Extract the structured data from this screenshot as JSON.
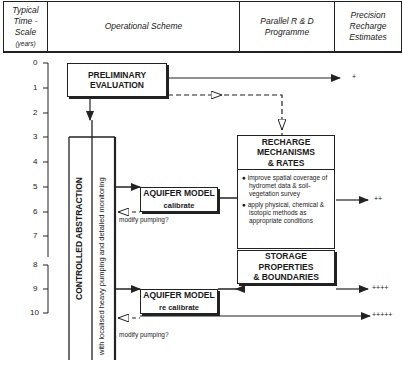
{
  "header": {
    "col1": {
      "line1": "Typical",
      "line2": "Time -",
      "line3": "Scale",
      "unit": "(years)"
    },
    "col2": "Operational Scheme",
    "col3": {
      "line1": "Parallel R & D",
      "line2": "Programme"
    },
    "col4": {
      "line1": "Precision",
      "line2": "Recharge",
      "line3": "Estimates"
    }
  },
  "time_axis": {
    "ticks": [
      "0",
      "1",
      "2",
      "3",
      "4",
      "5",
      "6",
      "7",
      "8",
      "9",
      "10"
    ]
  },
  "boxes": {
    "preliminary": {
      "line1": "PRELIMINARY",
      "line2": "EVALUATION"
    },
    "recharge": {
      "line1": "RECHARGE",
      "line2": "MECHANISMS",
      "line3": "& RATES"
    },
    "recharge_bullets": [
      "● improve spatial coverage of hydromet data & soil-vegetation survey",
      "● apply physical, chemical & isotopic methods as appropriate conditions"
    ],
    "storage": {
      "line1": "STORAGE",
      "line2": "PROPERTIES",
      "line3": "& BOUNDARIES"
    },
    "aquifer1": {
      "title": "AQUIFER MODEL",
      "sub": "calibrate"
    },
    "aquifer2": {
      "title": "AQUIFER MODEL",
      "sub": "re calibrate"
    },
    "controlled": "CONTROLLED ABSTRACTION",
    "monitoring": "with localised heavy pumping and detailed monitoring"
  },
  "labels": {
    "modify1": "modify pumping?",
    "modify2": "modify pumping?",
    "est1": "+",
    "est2": "++",
    "est3": "++++",
    "est4": "+++++"
  }
}
